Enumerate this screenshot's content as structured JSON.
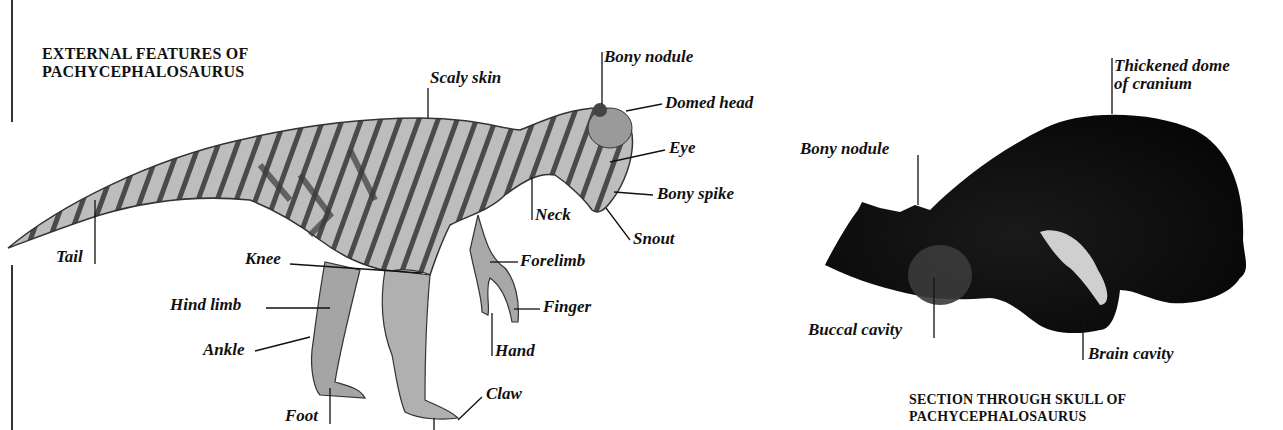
{
  "diagrams": {
    "external": {
      "title_line1": "EXTERNAL FEATURES OF",
      "title_line2": "PACHYCEPHALOSAURUS",
      "labels": {
        "scaly_skin": "Scaly skin",
        "bony_nodule": "Bony nodule",
        "domed_head": "Domed head",
        "eye": "Eye",
        "bony_spike": "Bony spike",
        "neck": "Neck",
        "snout": "Snout",
        "tail": "Tail",
        "knee": "Knee",
        "forelimb": "Forelimb",
        "hind_limb": "Hind limb",
        "finger": "Finger",
        "ankle": "Ankle",
        "hand": "Hand",
        "foot": "Foot",
        "claw": "Claw"
      }
    },
    "skull": {
      "title_line1": "SECTION THROUGH SKULL OF",
      "title_line2": "PACHYCEPHALOSAURUS",
      "labels": {
        "thickened_dome_line1": "Thickened dome",
        "thickened_dome_line2": "of cranium",
        "bony_nodule": "Bony nodule",
        "buccal_cavity": "Buccal cavity",
        "brain_cavity": "Brain cavity"
      }
    }
  },
  "colors": {
    "skin_light": "#b9b9b9",
    "skin_dark": "#3a3a3a",
    "skull": "#0a0a0a",
    "text": "#111111"
  }
}
